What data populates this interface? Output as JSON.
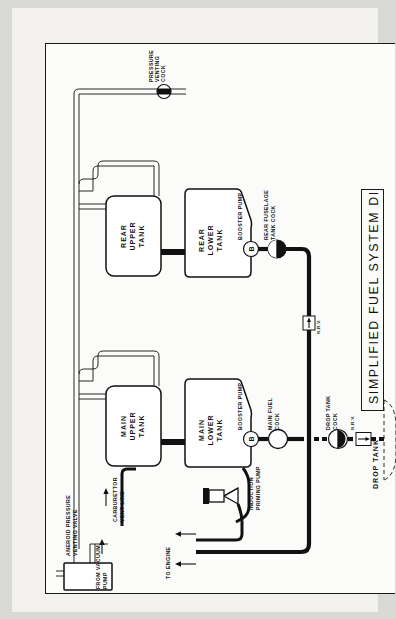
{
  "document": {
    "title": "SIMPLIFIED FUEL SYSTEM DIAGRAM",
    "type": "aircraft-fuel-system-schematic",
    "orientation": "rotated-90-ccw",
    "page_background": "#d9d9d7",
    "sheet_background": "#f2f1ef",
    "ink_color": "#111111"
  },
  "tanks": [
    {
      "id": "rear-upper-tank",
      "label": "REAR\nUPPER\nTANK",
      "lines": [
        "REAR",
        "UPPER",
        "TANK"
      ],
      "shape": "rounded-rect"
    },
    {
      "id": "rear-lower-tank",
      "label": "REAR\nLOWER\nTANK",
      "lines": [
        "REAR",
        "LOWER",
        "TANK"
      ],
      "shape": "tapered-polygon"
    },
    {
      "id": "main-upper-tank",
      "label": "MAIN\nUPPER\nTANK",
      "lines": [
        "MAIN",
        "UPPER",
        "TANK"
      ],
      "shape": "rounded-rect"
    },
    {
      "id": "main-lower-tank",
      "label": "MAIN\nLOWER\nTANK",
      "lines": [
        "MAIN",
        "LOWER",
        "TANK"
      ],
      "shape": "tapered-polygon"
    },
    {
      "id": "drop-tank",
      "label": "DROP TANK",
      "lines": [
        "DROP TANK"
      ],
      "shape": "dashed-outline"
    }
  ],
  "components": {
    "pressure_venting_cock": {
      "label": "PRESSURE\nVENTING\nCOCK",
      "lines": [
        "PRESSURE",
        "VENTING",
        "COCK"
      ],
      "symbol": "half-filled-circle-valve"
    },
    "aneroid_pressure_venting_valve": {
      "label": "ANEROID PRESSURE\nVENTING VALVE",
      "lines": [
        "ANEROID PRESSURE",
        "VENTING VALVE"
      ],
      "symbol": "rectangle-box"
    },
    "from_vacuum_pump": {
      "label": "FROM VACUUM\nPUMP",
      "lines": [
        "FROM VACUUM",
        "PUMP"
      ],
      "symbol": "inlet-arrow"
    },
    "carburettor_vent_line": {
      "label": "CARBURETTOR\nVENT LINE",
      "lines": [
        "CARBURETTOR",
        "VENT LINE"
      ],
      "symbol": "vent-pipe"
    },
    "rear_booster_pump": {
      "label": "BOOSTER PUMP",
      "badge": "B",
      "symbol": "circled-b"
    },
    "rear_fuselage_tank_cock": {
      "label": "REAR FUSELAGE\nTANK COCK",
      "lines": [
        "REAR FUSELAGE",
        "TANK COCK"
      ],
      "symbol": "half-filled-circle-cock"
    },
    "main_booster_pump": {
      "label": "BOOSTER PUMP",
      "badge": "B",
      "symbol": "circled-b"
    },
    "main_fuel_cock": {
      "label": "MAIN FUEL\nCOCK",
      "lines": [
        "MAIN FUEL",
        "COCK"
      ],
      "symbol": "open-circle-cock"
    },
    "drop_tank_cock": {
      "label": "DROP TANK\nCOCK",
      "lines": [
        "DROP TANK",
        "COCK"
      ],
      "symbol": "half-filled-circle-cock"
    },
    "nrv_rear_line": {
      "label": "N.R.V.",
      "symbol": "boxed-arrow-nonreturn-valve"
    },
    "nrv_drop_tank": {
      "label": "N.R.V.",
      "symbol": "boxed-arrow-nonreturn-valve"
    },
    "induction_priming_pump": {
      "label": "INDUCTION\nPRIMING PUMP",
      "lines": [
        "INDUCTION",
        "PRIMING PUMP"
      ],
      "symbol": "y-shaped-pump"
    },
    "to_engine": {
      "label": "TO ENGINE",
      "symbol": "double-flow-arrow"
    }
  }
}
